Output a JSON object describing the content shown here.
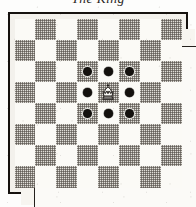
{
  "figure": {
    "caption": "The King",
    "kind": "chess-diagram"
  },
  "board": {
    "files": [
      "a",
      "b",
      "c",
      "d",
      "e",
      "f",
      "g",
      "h"
    ],
    "ranks": [
      "8",
      "7",
      "6",
      "5",
      "4",
      "3",
      "2",
      "1"
    ],
    "size": 8,
    "top_left_square_color": "light",
    "light_color": "#fbfaf6",
    "dark_color": "#c9c5bc",
    "marker_color": "#14110e",
    "frame_color": "#16120f"
  },
  "pieces": [
    {
      "type": "king",
      "color": "white",
      "square": "e5",
      "col": 4,
      "row": 3,
      "glyph": "white-king-icon"
    }
  ],
  "move_markers": [
    {
      "square": "d6",
      "col": 3,
      "row": 2
    },
    {
      "square": "e6",
      "col": 4,
      "row": 2
    },
    {
      "square": "f6",
      "col": 5,
      "row": 2
    },
    {
      "square": "d5",
      "col": 3,
      "row": 3
    },
    {
      "square": "f5",
      "col": 5,
      "row": 3
    },
    {
      "square": "d4",
      "col": 3,
      "row": 4
    },
    {
      "square": "e4",
      "col": 4,
      "row": 4
    },
    {
      "square": "f4",
      "col": 5,
      "row": 4
    }
  ]
}
